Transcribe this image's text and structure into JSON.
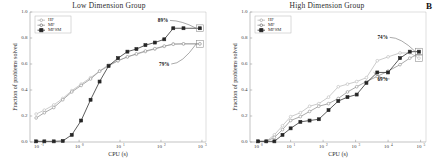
{
  "figure": {
    "panel_letter": "B",
    "colors": {
      "hf": "#b9b9b9",
      "mf": "#8d8d8d",
      "mfsm": "#262626",
      "axis": "#9a9a9a",
      "text": "#2b2b2b"
    }
  },
  "chart_data": [
    {
      "type": "line",
      "title": "Low Dimension Group",
      "xlabel": "CPU (s)",
      "ylabel": "Fraction of problems solved",
      "xscale": "log",
      "xlim": [
        -1.2,
        3.1
      ],
      "ylim": [
        0.0,
        1.0
      ],
      "grid": false,
      "legend_position": "upper-left",
      "xticks": [
        "10⁻¹",
        "10⁰",
        "10¹",
        "10²",
        "10³"
      ],
      "xtick_bases": [
        "10",
        "10",
        "10",
        "10",
        "10"
      ],
      "xtick_exponents": [
        "-1",
        "0",
        "1",
        "2",
        "3"
      ],
      "xtick_values": [
        -1,
        0,
        1,
        2,
        3
      ],
      "yticks": [
        "0.0",
        "0.2",
        "0.4",
        "0.6",
        "0.8",
        "1.0"
      ],
      "ytick_values": [
        0.0,
        0.2,
        0.4,
        0.6,
        0.8,
        1.0
      ],
      "annotations": [
        {
          "text": "89%",
          "x": 2.05,
          "y": 0.935,
          "target_x": 2.95,
          "target_y": 0.875
        },
        {
          "text": "79%",
          "x": 2.08,
          "y": 0.6,
          "target_x": 2.95,
          "target_y": 0.755
        }
      ],
      "series": [
        {
          "name": "HF",
          "color": "#b9b9b9",
          "marker": "circle",
          "x": [
            -1.05,
            -0.85,
            -0.62,
            -0.4,
            -0.18,
            0.05,
            0.28,
            0.5,
            0.72,
            0.95,
            1.18,
            1.4,
            1.62,
            1.85,
            2.08,
            2.3,
            2.55,
            2.95
          ],
          "y": [
            0.215,
            0.245,
            0.285,
            0.335,
            0.395,
            0.445,
            0.495,
            0.545,
            0.595,
            0.625,
            0.655,
            0.675,
            0.695,
            0.715,
            0.735,
            0.755,
            0.755,
            0.755
          ]
        },
        {
          "name": "MF",
          "color": "#8d8d8d",
          "marker": "circle",
          "x": [
            -1.05,
            -0.85,
            -0.62,
            -0.4,
            -0.18,
            0.05,
            0.28,
            0.5,
            0.72,
            0.95,
            1.18,
            1.4,
            1.62,
            1.85,
            2.08,
            2.3,
            2.55,
            2.95
          ],
          "y": [
            0.185,
            0.225,
            0.265,
            0.325,
            0.385,
            0.435,
            0.485,
            0.545,
            0.585,
            0.625,
            0.655,
            0.678,
            0.7,
            0.718,
            0.738,
            0.752,
            0.755,
            0.755
          ]
        },
        {
          "name": "MFSM",
          "color": "#262626",
          "marker": "square",
          "x": [
            -1.05,
            -0.85,
            -0.62,
            -0.4,
            -0.18,
            0.05,
            0.28,
            0.5,
            0.72,
            0.95,
            1.18,
            1.4,
            1.62,
            1.85,
            2.08,
            2.3,
            2.55,
            2.95
          ],
          "y": [
            0.005,
            0.005,
            0.005,
            0.008,
            0.055,
            0.165,
            0.325,
            0.465,
            0.585,
            0.645,
            0.695,
            0.715,
            0.745,
            0.765,
            0.79,
            0.875,
            0.875,
            0.875
          ]
        }
      ]
    },
    {
      "type": "line",
      "title": "High Dimension Group",
      "xlabel": "CPU (s)",
      "ylabel": "Fraction of problems solved",
      "xscale": "log",
      "xlim": [
        -0.15,
        3.1
      ],
      "ylim": [
        0.0,
        1.0
      ],
      "grid": false,
      "legend_position": "upper-left",
      "xticks": [
        "10⁰",
        "10¹",
        "10²",
        "10³",
        "10⁴",
        "10⁵"
      ],
      "xtick_bases": [
        "10",
        "10",
        "10",
        "10",
        "10",
        "10"
      ],
      "xtick_exponents": [
        "0",
        "1",
        "2",
        "3",
        "4",
        "5"
      ],
      "xtick_values": [
        0,
        0.6,
        1.2,
        1.8,
        2.4,
        3.0
      ],
      "yticks": [
        "0.0",
        "0.2",
        "0.4",
        "0.6",
        "0.8",
        "1.0"
      ],
      "ytick_values": [
        0.0,
        0.2,
        0.4,
        0.6,
        0.8,
        1.0
      ],
      "annotations": [
        {
          "text": "74%",
          "x": 2.3,
          "y": 0.805,
          "target_x": 2.97,
          "target_y": 0.695
        },
        {
          "text": "69%",
          "x": 2.3,
          "y": 0.485,
          "target_x": 2.2,
          "target_y": 0.535
        }
      ],
      "series": [
        {
          "name": "HF",
          "color": "#b9b9b9",
          "marker": "circle",
          "x": [
            0.0,
            0.15,
            0.3,
            0.45,
            0.6,
            0.78,
            0.95,
            1.12,
            1.3,
            1.48,
            1.65,
            1.82,
            2.0,
            2.2,
            2.4,
            2.62,
            2.8,
            2.97
          ],
          "y": [
            0.005,
            0.005,
            0.055,
            0.125,
            0.195,
            0.225,
            0.275,
            0.295,
            0.345,
            0.425,
            0.445,
            0.465,
            0.495,
            0.625,
            0.655,
            0.685,
            0.685,
            0.645
          ]
        },
        {
          "name": "MF",
          "color": "#8d8d8d",
          "marker": "circle",
          "x": [
            0.0,
            0.15,
            0.3,
            0.45,
            0.6,
            0.78,
            0.95,
            1.12,
            1.3,
            1.48,
            1.65,
            1.82,
            2.0,
            2.2,
            2.4,
            2.62,
            2.8,
            2.97
          ],
          "y": [
            0.005,
            0.005,
            0.035,
            0.095,
            0.165,
            0.195,
            0.235,
            0.275,
            0.295,
            0.335,
            0.385,
            0.425,
            0.465,
            0.505,
            0.545,
            0.595,
            0.645,
            0.68
          ]
        },
        {
          "name": "MFSM",
          "color": "#262626",
          "marker": "square",
          "x": [
            0.0,
            0.15,
            0.3,
            0.45,
            0.6,
            0.78,
            0.95,
            1.12,
            1.3,
            1.48,
            1.65,
            1.82,
            2.0,
            2.2,
            2.4,
            2.62,
            2.8,
            2.97
          ],
          "y": [
            0.005,
            0.005,
            0.005,
            0.055,
            0.105,
            0.155,
            0.165,
            0.175,
            0.245,
            0.315,
            0.345,
            0.365,
            0.455,
            0.535,
            0.535,
            0.645,
            0.695,
            0.695
          ]
        }
      ]
    }
  ]
}
